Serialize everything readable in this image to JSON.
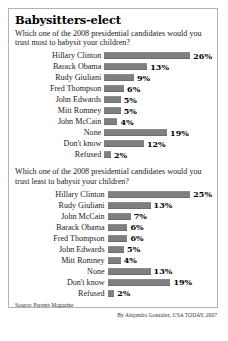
{
  "title": "Babysitters-elect",
  "source": "Source: Parents Magazine",
  "credit": "By Alejandro Gonzalez, USA TODAY, 2007",
  "chart_data": [
    {
      "type": "bar",
      "title": "Babysitters-elect",
      "question": "Which one of the 2008 presidential candidates would you trust most to babysit your children?",
      "xlabel": "",
      "ylabel": "",
      "xlim": [
        0,
        26
      ],
      "grid": false,
      "legend": "none",
      "orientation": "horizontal",
      "categories": [
        "Hillary Clinton",
        "Barack Obama",
        "Rudy Giuliani",
        "Fred Thompson",
        "John Edwards",
        "Mitt Romney",
        "John McCain",
        "None",
        "Don't know",
        "Refused"
      ],
      "values": [
        26,
        13,
        9,
        6,
        5,
        5,
        4,
        19,
        12,
        2
      ],
      "labels": [
        "26%",
        "13%",
        "9%",
        "6%",
        "5%",
        "5%",
        "4%",
        "19%",
        "12%",
        "2%"
      ]
    },
    {
      "type": "bar",
      "question": "Which one of the 2008 presidential candidates would you trust least to babysit your children?",
      "xlabel": "",
      "ylabel": "",
      "xlim": [
        0,
        26
      ],
      "grid": false,
      "legend": "none",
      "orientation": "horizontal",
      "categories": [
        "Hillary Clinton",
        "Rudy Giuliani",
        "John McCain",
        "Barack Obama",
        "Fred Thompson",
        "John Edwards",
        "Mitt Romney",
        "None",
        "Don't know",
        "Refused"
      ],
      "values": [
        25,
        13,
        7,
        6,
        6,
        5,
        4,
        13,
        19,
        2
      ],
      "labels": [
        "25%",
        "13%",
        "7%",
        "6%",
        "6%",
        "5%",
        "4%",
        "13%",
        "19%",
        "2%"
      ]
    }
  ],
  "colors": {
    "bar": "#807f7f",
    "frame_border": "#b3b3b3",
    "background": "#ffffff",
    "text": "#1a1a1a"
  }
}
